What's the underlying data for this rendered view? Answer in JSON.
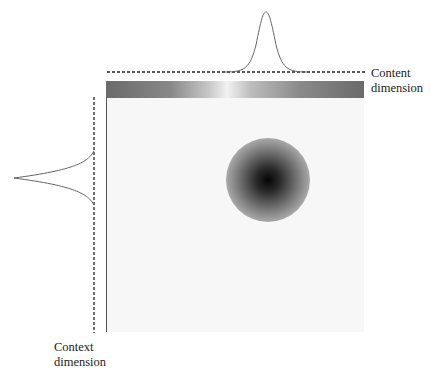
{
  "labels": {
    "content_line1": "Content",
    "content_line2": "dimension",
    "context_line1": "Context",
    "context_line2": "dimension"
  },
  "colors": {
    "panel_bg": "#f7f7f7",
    "curve": "#555555",
    "blob_center": "#050505",
    "blob_edge": "#d9d9d9"
  }
}
